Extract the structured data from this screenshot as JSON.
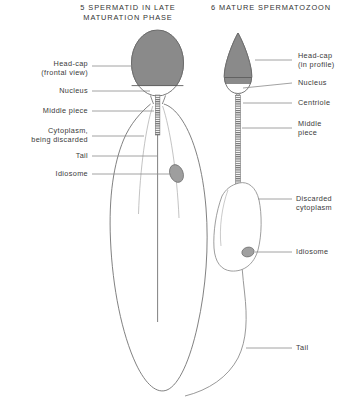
{
  "figure": {
    "kind": "biology-diagram",
    "background_color": "#ffffff",
    "ink_color": "#3a3a3a",
    "fill_grey": "#8a8a8a"
  },
  "panels": [
    {
      "id": "panel-5",
      "number": "5",
      "title": "5  SPERMATID IN LATE\nMATURATION PHASE",
      "title_line_1": "5  SPERMATID IN LATE",
      "title_line_2": "MATURATION PHASE"
    },
    {
      "id": "panel-6",
      "number": "6",
      "title": "6  MATURE SPERMATOZOON",
      "title_line_1": "6  MATURE SPERMATOZOON",
      "title_line_2": ""
    }
  ],
  "labels_left": [
    {
      "id": "head-cap-frontal",
      "text": "Head-cap\n(frontal view)"
    },
    {
      "id": "nucleus-left",
      "text": "Nucleus"
    },
    {
      "id": "middle-piece-left",
      "text": "Middle piece"
    },
    {
      "id": "cytoplasm-discarded",
      "text": "Cytoplasm,\nbeing discarded"
    },
    {
      "id": "tail-left",
      "text": "Tail"
    },
    {
      "id": "idiosome-left",
      "text": "Idiosome"
    }
  ],
  "labels_right": [
    {
      "id": "head-cap-profile",
      "text": "Head-cap\n(in profile)"
    },
    {
      "id": "nucleus-right",
      "text": "Nucleus"
    },
    {
      "id": "centriole",
      "text": "Centriole"
    },
    {
      "id": "middle-piece-right",
      "text": "Middle\npiece"
    },
    {
      "id": "discarded-cytoplasm",
      "text": "Discarded\ncytoplasm"
    },
    {
      "id": "idiosome-right",
      "text": "Idiosome"
    },
    {
      "id": "tail-right",
      "text": "Tail"
    }
  ]
}
